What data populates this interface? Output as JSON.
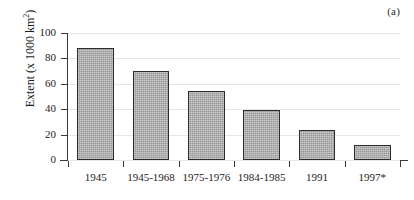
{
  "panel": {
    "label": "(a)"
  },
  "chart_data": {
    "type": "bar",
    "title": "",
    "subtitle": "",
    "xlabel": "",
    "ylabel": "Extent (x 1000 km2)",
    "ylabel_base": "Extent (x 1000 km",
    "ylabel_sup": "2",
    "ylabel_tail": ")",
    "categories": [
      "1945",
      "1945-1968",
      "1975-1976",
      "1984-1985",
      "1991",
      "1997*"
    ],
    "values": [
      88,
      70,
      54,
      39,
      24,
      12
    ],
    "ylim": [
      0,
      100
    ],
    "ytick_labels": [
      "100",
      "80",
      "60",
      "40",
      "20",
      "0"
    ],
    "ytick_values": [
      100,
      80,
      60,
      40,
      20,
      0
    ],
    "grid": true,
    "grid_axis": "y",
    "legend": "none",
    "bar_color": "#a9a9a9",
    "bar_edge_color": "#2c2c2c",
    "axis_color": "#3a3a3a",
    "grid_color": "#e6e6e6",
    "background": "#ffffff"
  }
}
